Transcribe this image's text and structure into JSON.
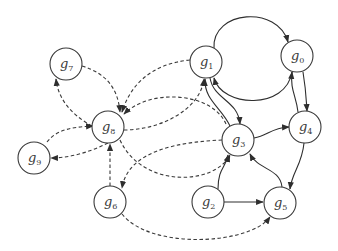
{
  "diagram": {
    "type": "directed-graph",
    "nodes": [
      {
        "id": "g0",
        "label": "g",
        "sub": "0",
        "x": 297,
        "y": 56
      },
      {
        "id": "g1",
        "label": "g",
        "sub": "1",
        "x": 206,
        "y": 62
      },
      {
        "id": "g2",
        "label": "g",
        "sub": "2",
        "x": 208,
        "y": 202
      },
      {
        "id": "g3",
        "label": "g",
        "sub": "3",
        "x": 238,
        "y": 140
      },
      {
        "id": "g4",
        "label": "g",
        "sub": "4",
        "x": 305,
        "y": 127
      },
      {
        "id": "g5",
        "label": "g",
        "sub": "5",
        "x": 280,
        "y": 203
      },
      {
        "id": "g6",
        "label": "g",
        "sub": "6",
        "x": 110,
        "y": 202
      },
      {
        "id": "g7",
        "label": "g",
        "sub": "7",
        "x": 66,
        "y": 64
      },
      {
        "id": "g8",
        "label": "g",
        "sub": "8",
        "x": 108,
        "y": 127
      },
      {
        "id": "g9",
        "label": "g",
        "sub": "9",
        "x": 34,
        "y": 158
      }
    ],
    "edges_solid": [
      {
        "from": "g1",
        "to": "g0"
      },
      {
        "from": "g0",
        "to": "g1"
      },
      {
        "from": "g1",
        "to": "g3"
      },
      {
        "from": "g3",
        "to": "g1"
      },
      {
        "from": "g0",
        "to": "g4"
      },
      {
        "from": "g4",
        "to": "g0"
      },
      {
        "from": "g3",
        "to": "g4"
      },
      {
        "from": "g4",
        "to": "g5"
      },
      {
        "from": "g5",
        "to": "g3"
      },
      {
        "from": "g2",
        "to": "g3"
      },
      {
        "from": "g2",
        "to": "g5"
      }
    ],
    "edges_dashed": [
      {
        "from": "g7",
        "to": "g8"
      },
      {
        "from": "g8",
        "to": "g7"
      },
      {
        "from": "g9",
        "to": "g8"
      },
      {
        "from": "g8",
        "to": "g9"
      },
      {
        "from": "g6",
        "to": "g8"
      },
      {
        "from": "g1",
        "to": "g8"
      },
      {
        "from": "g3",
        "to": "g8"
      },
      {
        "from": "g8",
        "to": "g1"
      },
      {
        "from": "g8",
        "to": "g3"
      },
      {
        "from": "g3",
        "to": "g6"
      },
      {
        "from": "g6",
        "to": "g5"
      }
    ]
  }
}
